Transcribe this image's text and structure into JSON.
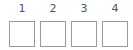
{
  "code_entry": {
    "slots": [
      {
        "label": "1",
        "value": ""
      },
      {
        "label": "2",
        "value": ""
      },
      {
        "label": "3",
        "value": ""
      },
      {
        "label": "4",
        "value": ""
      }
    ]
  },
  "colors": {
    "label_text": "#555555",
    "box_border": "#9a9a9a",
    "background": "#ffffff"
  }
}
